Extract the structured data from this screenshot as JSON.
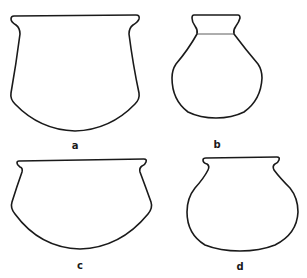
{
  "figure": {
    "stroke_color": "#1a1a1a",
    "background": "#ffffff",
    "vessels": [
      {
        "id": "a",
        "label": "a",
        "form": "jar with flared rim, straight-tapering walls, rounded base"
      },
      {
        "id": "b",
        "label": "b",
        "form": "globular jar with tall flaring neck"
      },
      {
        "id": "c",
        "label": "c",
        "form": "wide bowl with everted rim and rounded base"
      },
      {
        "id": "d",
        "label": "d",
        "form": "globular jar with short everted rim"
      }
    ]
  }
}
